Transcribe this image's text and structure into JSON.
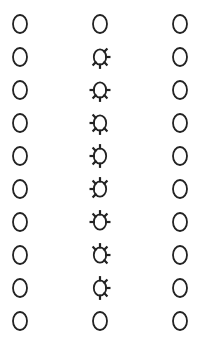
{
  "grid": {
    "rows": 10,
    "columns": 3,
    "column_centers_x": [
      20,
      100,
      180
    ],
    "row_centers_y": [
      24,
      57,
      90,
      123,
      156,
      189,
      222,
      255,
      288,
      321
    ],
    "stroke_color": "#222222",
    "plain_glyph": "O",
    "cells": [
      [
        {
          "type": "plain"
        },
        {
          "type": "plain"
        },
        {
          "type": "plain"
        }
      ],
      [
        {
          "type": "plain"
        },
        {
          "type": "ticked",
          "ticks": [
            45,
            90,
            135,
            180,
            225
          ]
        },
        {
          "type": "plain"
        }
      ],
      [
        {
          "type": "plain"
        },
        {
          "type": "ticked",
          "ticks": [
            90,
            135,
            180,
            225,
            270
          ]
        },
        {
          "type": "plain"
        }
      ],
      [
        {
          "type": "plain"
        },
        {
          "type": "ticked",
          "ticks": [
            135,
            180,
            225,
            270,
            315
          ]
        },
        {
          "type": "plain"
        }
      ],
      [
        {
          "type": "plain"
        },
        {
          "type": "ticked",
          "ticks": [
            180,
            225,
            270,
            315,
            0
          ]
        },
        {
          "type": "plain"
        }
      ],
      [
        {
          "type": "plain"
        },
        {
          "type": "ticked",
          "ticks": [
            225,
            270,
            315,
            0,
            45
          ]
        },
        {
          "type": "plain"
        }
      ],
      [
        {
          "type": "plain"
        },
        {
          "type": "ticked",
          "ticks": [
            270,
            315,
            0,
            45,
            90
          ]
        },
        {
          "type": "plain"
        }
      ],
      [
        {
          "type": "plain"
        },
        {
          "type": "ticked",
          "ticks": [
            315,
            0,
            45,
            90,
            135
          ]
        },
        {
          "type": "plain"
        }
      ],
      [
        {
          "type": "plain"
        },
        {
          "type": "ticked",
          "ticks": [
            0,
            45,
            90,
            135,
            180
          ]
        },
        {
          "type": "plain"
        }
      ],
      [
        {
          "type": "plain"
        },
        {
          "type": "plain"
        },
        {
          "type": "plain"
        }
      ]
    ],
    "icons": {
      "plain": "letter-o-icon",
      "ticked": "ticked-circle-icon"
    }
  }
}
